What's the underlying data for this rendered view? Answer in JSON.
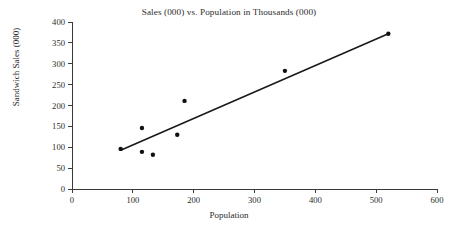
{
  "chart_data": {
    "type": "scatter",
    "title": "Sales (000) vs. Population in Thousands (000)",
    "xlabel": "Population",
    "ylabel": "Sandwich Sales (000)",
    "xlim": [
      0,
      600
    ],
    "ylim": [
      0,
      400
    ],
    "xticks": [
      0,
      100,
      200,
      300,
      400,
      500,
      600
    ],
    "yticks": [
      0,
      50,
      100,
      150,
      200,
      250,
      300,
      350,
      400
    ],
    "xtick_labels": [
      "0",
      "100",
      "200",
      "300",
      "400",
      "500",
      "600"
    ],
    "ytick_labels": [
      "0",
      "50",
      "100",
      "150",
      "200",
      "250",
      "300",
      "350",
      "400"
    ],
    "grid": false,
    "legend": false,
    "marker_color": "#111111",
    "line_color": "#1a1a1a",
    "axis_color": "#3a3a3a",
    "background_color": "#ffffff",
    "points": [
      {
        "x": 80,
        "y": 96
      },
      {
        "x": 115,
        "y": 146
      },
      {
        "x": 115,
        "y": 89
      },
      {
        "x": 133,
        "y": 82
      },
      {
        "x": 173,
        "y": 130
      },
      {
        "x": 185,
        "y": 211
      },
      {
        "x": 350,
        "y": 283
      },
      {
        "x": 520,
        "y": 372
      }
    ],
    "trendline": {
      "type": "linear",
      "x_start": 80,
      "y_start": 93,
      "x_end": 520,
      "y_end": 372
    }
  }
}
